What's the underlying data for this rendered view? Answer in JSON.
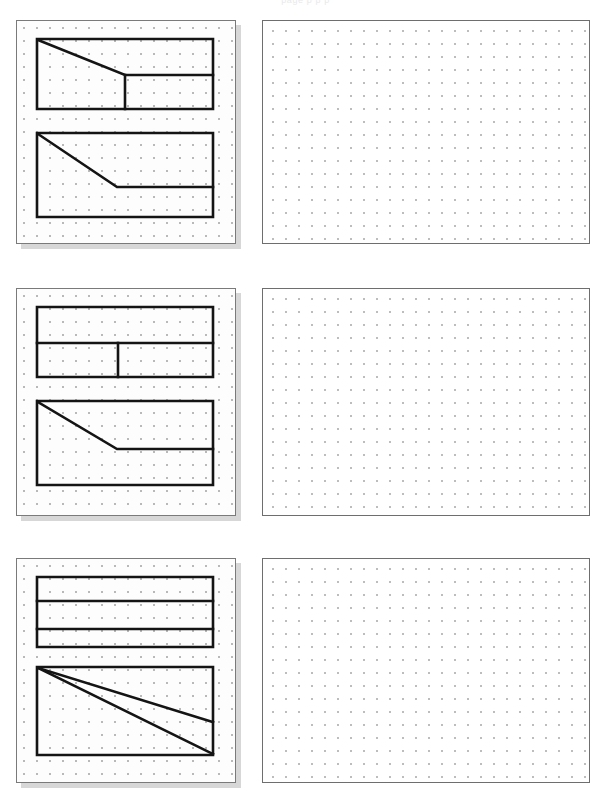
{
  "page": {
    "header_text": "page p p p",
    "width": 611,
    "height": 793,
    "background_color": "#ffffff"
  },
  "grid": {
    "dot_spacing_px": 13,
    "dot_color": "#b9b9b9",
    "stroke_color": "#141414",
    "stroke_width_px": 2.6,
    "card_border_color": "#7a7a7a",
    "card_shadow_color": "#969696"
  },
  "rows": [
    {
      "index": 1,
      "label": "row-1",
      "problem": {
        "label": "problem-1",
        "figures": [
          {
            "label": "figure-1a",
            "description": "rectangle with diagonal cut from top-left to middle-right and an interior vertical divider",
            "outline": "M 20 18 L 196 18 L 196 88 L 20 88 Z",
            "interior_paths": [
              "M 21 19 L 108 54 L 196 54",
              "M 108 54 L 108 88"
            ]
          },
          {
            "label": "figure-1b",
            "description": "rectangle with diagonal from top-left down to a horizontal ledge running to the right edge",
            "outline": "M 20 112 L 196 112 L 196 196 L 20 196 Z",
            "interior_paths": [
              "M 21 113 L 100 166 L 196 166"
            ]
          }
        ]
      },
      "answer": {
        "label": "answer-area-1",
        "content": ""
      }
    },
    {
      "index": 2,
      "label": "row-2",
      "problem": {
        "label": "problem-2",
        "figures": [
          {
            "label": "figure-2a",
            "description": "rectangle split by one horizontal divider, lower band split by a vertical divider",
            "outline": "M 20 18 L 196 18 L 196 88 L 20 88 Z",
            "interior_paths": [
              "M 20 54 L 196 54",
              "M 101 54 L 101 88"
            ]
          },
          {
            "label": "figure-2b",
            "description": "rectangle with diagonal from top-left down to a horizontal ledge running to the right edge",
            "outline": "M 20 112 L 196 112 L 196 196 L 20 196 Z",
            "interior_paths": [
              "M 21 113 L 100 160 L 196 160"
            ]
          }
        ]
      },
      "answer": {
        "label": "answer-area-2",
        "content": ""
      }
    },
    {
      "index": 3,
      "label": "row-3",
      "problem": {
        "label": "problem-3",
        "figures": [
          {
            "label": "figure-3a",
            "description": "rectangle split into three horizontal bands by two dividers",
            "outline": "M 20 18 L 196 18 L 196 88 L 20 88 Z",
            "interior_paths": [
              "M 20 42 L 196 42",
              "M 20 70 L 196 70"
            ]
          },
          {
            "label": "figure-3b",
            "description": "rectangle with two lines fanning from the top-left corner to the right edge and the bottom-right corner",
            "outline": "M 20 108 L 196 108 L 196 196 L 20 196 Z",
            "interior_paths": [
              "M 21 109 L 196 163",
              "M 21 109 L 196 195"
            ]
          }
        ]
      },
      "answer": {
        "label": "answer-area-3",
        "content": ""
      }
    }
  ]
}
